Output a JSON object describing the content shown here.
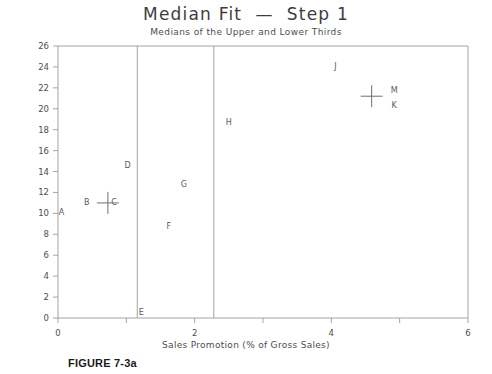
{
  "figure": {
    "title": "Median Fit  —  Step 1",
    "subtitle": "Medians of the Upper and Lower Thirds",
    "caption": "FIGURE 7-3a"
  },
  "chart_data": {
    "type": "scatter",
    "title": "Median Fit  —  Step 1",
    "subtitle": "Medians of the Upper and Lower Thirds",
    "xlabel": "Sales Promotion (% of Gross Sales)",
    "ylabel": "",
    "xlim": [
      0,
      6
    ],
    "ylim": [
      0,
      26
    ],
    "xticks": [
      0,
      1,
      2,
      3,
      4,
      5,
      6
    ],
    "xtick_labels": [
      "0",
      "",
      "2",
      "",
      "4",
      "",
      "6"
    ],
    "yticks": [
      0,
      2,
      4,
      6,
      8,
      10,
      12,
      14,
      16,
      18,
      20,
      22,
      24,
      26
    ],
    "ytick_labels": [
      "0",
      "2",
      "4",
      "6",
      "8",
      "10",
      "12",
      "14",
      "16",
      "18",
      "20",
      "22",
      "24",
      "26"
    ],
    "grid": false,
    "legend": null,
    "points": [
      {
        "label": "A",
        "x": 0.05,
        "y": 10.1
      },
      {
        "label": "B",
        "x": 0.42,
        "y": 11.1
      },
      {
        "label": "C",
        "x": 0.82,
        "y": 11.1
      },
      {
        "label": "D",
        "x": 1.02,
        "y": 14.6
      },
      {
        "label": "E",
        "x": 1.22,
        "y": 0.55
      },
      {
        "label": "F",
        "x": 1.62,
        "y": 8.8
      },
      {
        "label": "G",
        "x": 1.84,
        "y": 12.8
      },
      {
        "label": "H",
        "x": 2.5,
        "y": 18.7
      },
      {
        "label": "J",
        "x": 4.06,
        "y": 24.1
      },
      {
        "label": "K",
        "x": 4.92,
        "y": 20.4
      },
      {
        "label": "M",
        "x": 4.92,
        "y": 21.8
      }
    ],
    "median_markers": [
      {
        "name": "lower-third-median",
        "x": 0.73,
        "y": 11.0
      },
      {
        "name": "upper-third-median",
        "x": 4.59,
        "y": 21.2
      }
    ],
    "divider_lines": [
      {
        "name": "lower-third-boundary",
        "x": 1.16
      },
      {
        "name": "upper-third-boundary",
        "x": 2.28
      }
    ]
  }
}
